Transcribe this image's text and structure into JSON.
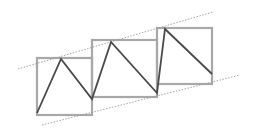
{
  "diagram": {
    "width": 255,
    "height": 138,
    "background": "#ffffff",
    "colors": {
      "box_stroke": "#a8a8a8",
      "zigzag_stroke": "#4a4a4a",
      "guide_stroke": "#9a9a9a"
    },
    "boxes": [
      {
        "x": 37,
        "y": 58,
        "w": 55,
        "h": 57
      },
      {
        "x": 92,
        "y": 40,
        "w": 65,
        "h": 57
      },
      {
        "x": 157,
        "y": 28,
        "w": 55,
        "h": 56
      }
    ],
    "zigzag": [
      [
        37,
        113
      ],
      [
        61,
        59
      ],
      [
        92,
        99
      ],
      [
        111,
        42
      ],
      [
        157,
        93
      ],
      [
        165,
        29
      ],
      [
        212,
        74
      ]
    ],
    "guide_lines": [
      {
        "name": "upper-trend-line",
        "x1": 18,
        "y1": 69,
        "x2": 213,
        "y2": 12
      },
      {
        "name": "lower-trend-line",
        "x1": 42,
        "y1": 125,
        "x2": 240,
        "y2": 75
      }
    ]
  }
}
